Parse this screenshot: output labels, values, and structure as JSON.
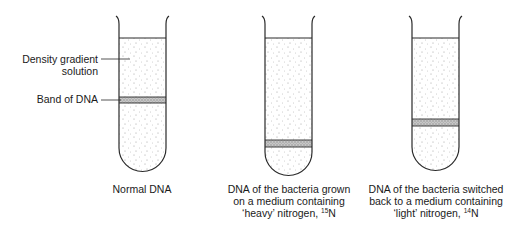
{
  "annotations": {
    "density_gradient": "Density gradient solution",
    "density_gradient_line1": "Density gradient",
    "density_gradient_line2": "solution",
    "band_of_dna": "Band of DNA"
  },
  "tubes": [
    {
      "id": "normal",
      "caption_lines": [
        "Normal DNA"
      ],
      "band_position": "middle"
    },
    {
      "id": "heavy",
      "caption_lines": [
        "DNA of the bacteria grown",
        "on a medium containing",
        "‘heavy’ nitrogen, "
      ],
      "isotope_mass": "15",
      "isotope_symbol": "N",
      "band_position": "bottom"
    },
    {
      "id": "light",
      "caption_lines": [
        "DNA of the bacteria switched",
        "back to a medium containing",
        "‘light’ nitrogen, "
      ],
      "isotope_mass": "14",
      "isotope_symbol": "N",
      "band_position": "intermediate"
    }
  ],
  "colors": {
    "outline": "#2a2a2a",
    "stipple": "#8a8a8a",
    "band": "#bdbdbd"
  }
}
